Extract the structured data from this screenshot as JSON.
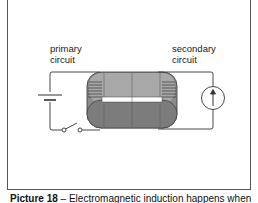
{
  "figure": {
    "labels": {
      "primary": [
        "primary",
        "circuit"
      ],
      "secondary": [
        "secondary",
        "circuit"
      ]
    },
    "components": [
      "battery-icon",
      "switch-icon",
      "iron-core-icon",
      "galvanometer-icon"
    ],
    "caption": {
      "number": "Picture 18",
      "text": "– Electromagnetic induction happens when"
    }
  }
}
